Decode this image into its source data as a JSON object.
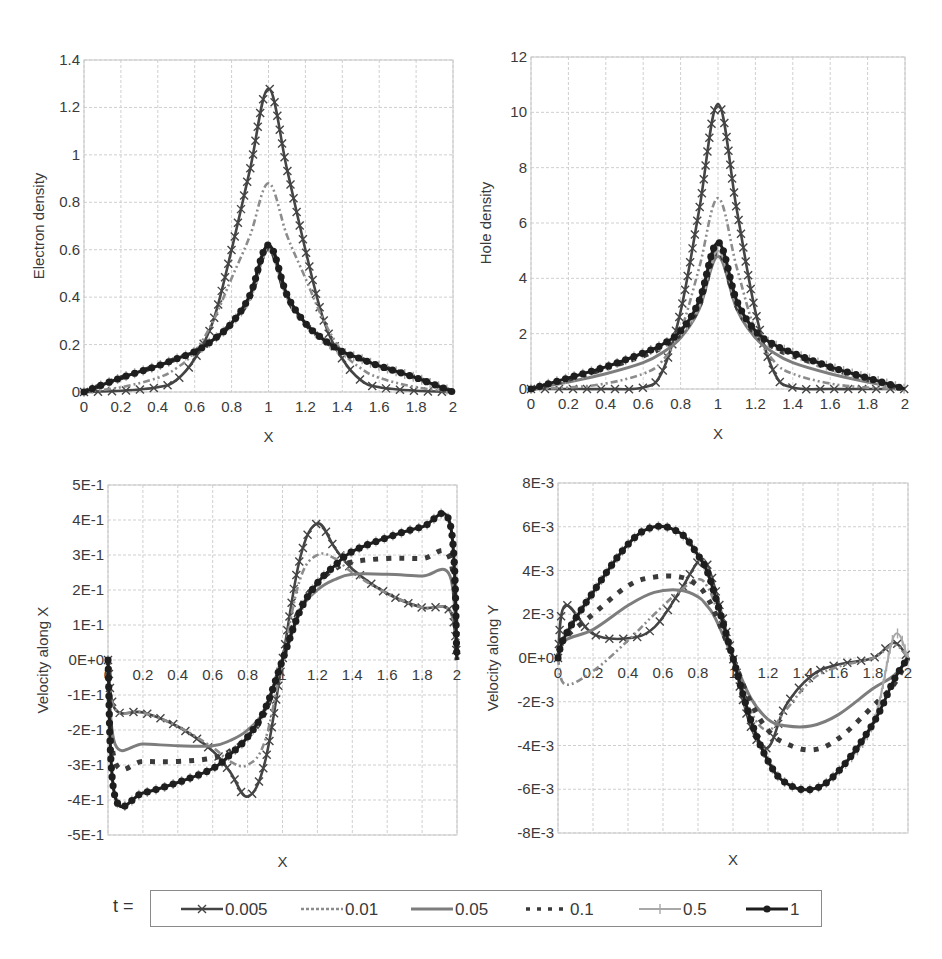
{
  "legend": {
    "title": "t =",
    "entries": [
      {
        "label": "0.005",
        "color": "#444444",
        "width": 2.6,
        "dash": "",
        "marker": "x"
      },
      {
        "label": "0.01",
        "color": "#8c8c8c",
        "width": 2.6,
        "dash": "7,3,2,3,2,3",
        "marker": ""
      },
      {
        "label": "0.05",
        "color": "#7d7d7d",
        "width": 3,
        "dash": "",
        "marker": ""
      },
      {
        "label": "0.1",
        "color": "#3a3a3a",
        "width": 5,
        "dash": "5,8",
        "marker": ""
      },
      {
        "label": "0.5",
        "color": "#a8a8a8",
        "width": 2,
        "dash": "",
        "marker": "plus"
      },
      {
        "label": "1",
        "color": "#1e1e1e",
        "width": 3,
        "dash": "",
        "marker": "dot"
      }
    ]
  },
  "chart_data": [
    {
      "id": "electron-density",
      "type": "line",
      "title": "",
      "xlabel": "X",
      "ylabel": "Electron density",
      "xlim": [
        0,
        2
      ],
      "ylim": [
        0,
        1.4
      ],
      "grid": true,
      "legend_position": "bottom (shared)",
      "frame": {
        "left": 84,
        "right": 453,
        "top": 60,
        "bottom": 392
      },
      "xticks": {
        "values": [
          0,
          0.2,
          0.4,
          0.6,
          0.8,
          1,
          1.2,
          1.4,
          1.6,
          1.8,
          2
        ],
        "labels": [
          "0",
          "0.2",
          "0.4",
          "0.6",
          "0.8",
          "1",
          "1.2",
          "1.4",
          "1.6",
          "1.8",
          "2"
        ],
        "label_zero": 0
      },
      "yticks": {
        "values": [
          0,
          0.2,
          0.4,
          0.6,
          0.8,
          1,
          1.2,
          1.4
        ],
        "labels": [
          "0",
          "0.2",
          "0.4",
          "0.6",
          "0.8",
          "1",
          "1.2",
          "1.4"
        ]
      },
      "x": [
        0,
        0.2,
        0.4,
        0.5,
        0.6,
        0.7,
        0.8,
        0.9,
        1.0,
        1.1,
        1.2,
        1.3,
        1.4,
        1.5,
        1.6,
        1.8,
        2.0
      ],
      "series": [
        {
          "name": "0.005",
          "values": [
            0.0,
            0.005,
            0.02,
            0.05,
            0.14,
            0.3,
            0.6,
            0.94,
            1.28,
            0.94,
            0.6,
            0.3,
            0.14,
            0.05,
            0.02,
            0.005,
            0.0
          ]
        },
        {
          "name": "0.01",
          "values": [
            0.0,
            0.02,
            0.06,
            0.1,
            0.17,
            0.3,
            0.48,
            0.66,
            0.88,
            0.66,
            0.48,
            0.3,
            0.17,
            0.1,
            0.06,
            0.02,
            0.0
          ]
        },
        {
          "name": "0.05",
          "values": [
            0.0,
            0.06,
            0.11,
            0.14,
            0.17,
            0.22,
            0.29,
            0.4,
            0.6,
            0.4,
            0.29,
            0.22,
            0.17,
            0.14,
            0.11,
            0.06,
            0.0
          ]
        },
        {
          "name": "0.1",
          "values": [
            0.0,
            0.06,
            0.11,
            0.14,
            0.17,
            0.22,
            0.29,
            0.4,
            0.61,
            0.4,
            0.29,
            0.22,
            0.17,
            0.14,
            0.11,
            0.06,
            0.0
          ]
        },
        {
          "name": "0.5",
          "values": [
            0.0,
            0.06,
            0.11,
            0.14,
            0.17,
            0.22,
            0.29,
            0.4,
            0.61,
            0.4,
            0.29,
            0.22,
            0.17,
            0.14,
            0.11,
            0.06,
            0.0
          ]
        },
        {
          "name": "1",
          "values": [
            0.0,
            0.06,
            0.11,
            0.14,
            0.17,
            0.22,
            0.29,
            0.41,
            0.62,
            0.41,
            0.29,
            0.22,
            0.17,
            0.14,
            0.11,
            0.06,
            0.0
          ]
        }
      ]
    },
    {
      "id": "hole-density",
      "type": "line",
      "title": "",
      "xlabel": "X",
      "ylabel": "Hole density",
      "xlim": [
        0,
        2
      ],
      "ylim": [
        0,
        12
      ],
      "grid": true,
      "legend_position": "bottom (shared)",
      "frame": {
        "left": 531,
        "right": 905,
        "top": 57,
        "bottom": 389
      },
      "xticks": {
        "values": [
          0,
          0.2,
          0.4,
          0.6,
          0.8,
          1,
          1.2,
          1.4,
          1.6,
          1.8,
          2
        ],
        "labels": [
          "0",
          "0.2",
          "0.4",
          "0.6",
          "0.8",
          "1",
          "1.2",
          "1.4",
          "1.6",
          "1.8",
          "2"
        ],
        "label_zero": 0
      },
      "yticks": {
        "values": [
          0,
          2,
          4,
          6,
          8,
          10,
          12
        ],
        "labels": [
          "0",
          "2",
          "4",
          "6",
          "8",
          "10",
          "12"
        ]
      },
      "x": [
        0,
        0.2,
        0.4,
        0.6,
        0.7,
        0.8,
        0.9,
        1.0,
        1.1,
        1.2,
        1.3,
        1.4,
        1.6,
        1.8,
        2.0
      ],
      "series": [
        {
          "name": "0.005",
          "values": [
            0.0,
            0.0,
            0.0,
            0.05,
            0.6,
            2.8,
            6.5,
            10.3,
            6.5,
            2.8,
            0.6,
            0.05,
            0.0,
            0.0,
            0.0
          ]
        },
        {
          "name": "0.01",
          "values": [
            0.0,
            0.05,
            0.2,
            0.55,
            1.0,
            2.1,
            4.4,
            6.9,
            4.4,
            2.1,
            1.0,
            0.55,
            0.2,
            0.05,
            0.0
          ]
        },
        {
          "name": "0.05",
          "values": [
            0.0,
            0.25,
            0.55,
            0.95,
            1.3,
            1.85,
            2.9,
            4.8,
            2.9,
            1.85,
            1.3,
            0.95,
            0.55,
            0.25,
            0.0
          ]
        },
        {
          "name": "0.1",
          "values": [
            0.0,
            0.35,
            0.75,
            1.2,
            1.5,
            2.0,
            3.0,
            5.0,
            3.0,
            2.0,
            1.5,
            1.2,
            0.75,
            0.35,
            0.0
          ]
        },
        {
          "name": "0.5",
          "values": [
            0.0,
            0.4,
            0.8,
            1.3,
            1.6,
            2.05,
            3.05,
            5.0,
            3.05,
            2.05,
            1.6,
            1.3,
            0.8,
            0.4,
            0.0
          ]
        },
        {
          "name": "1",
          "values": [
            0.0,
            0.4,
            0.8,
            1.3,
            1.6,
            2.1,
            3.2,
            5.3,
            3.2,
            2.1,
            1.6,
            1.3,
            0.8,
            0.4,
            0.0
          ]
        }
      ]
    },
    {
      "id": "velocity-x",
      "type": "line",
      "title": "",
      "xlabel": "X",
      "ylabel": "Velocity along X",
      "xlim": [
        0,
        2
      ],
      "ylim": [
        -0.5,
        0.5
      ],
      "grid": true,
      "legend_position": "bottom (shared)",
      "frame": {
        "left": 108,
        "right": 457,
        "top": 485,
        "bottom": 835
      },
      "xticks": {
        "values": [
          0,
          0.2,
          0.4,
          0.6,
          0.8,
          1,
          1.2,
          1.4,
          1.6,
          1.8,
          2
        ],
        "labels": [
          "0",
          "0.2",
          "0.4",
          "0.6",
          "0.8",
          "1",
          "1.2",
          "1.4",
          "1.6",
          "1.8",
          "2"
        ],
        "label_zero": 0
      },
      "yticks": {
        "values": [
          -0.5,
          -0.4,
          -0.3,
          -0.2,
          -0.1,
          0,
          0.1,
          0.2,
          0.3,
          0.4,
          0.5
        ],
        "labels": [
          "-5E-1",
          "-4E-1",
          "-3E-1",
          "-2E-1",
          "-1E-1",
          "0E+0",
          "1E-1",
          "2E-1",
          "3E-1",
          "4E-1",
          "5E-1"
        ]
      },
      "x": [
        0,
        0.04,
        0.2,
        0.4,
        0.6,
        0.7,
        0.8,
        0.9,
        1.0,
        1.1,
        1.2,
        1.3,
        1.4,
        1.6,
        1.8,
        1.96,
        2.0
      ],
      "series": [
        {
          "name": "0.005",
          "values": [
            0.0,
            -0.14,
            -0.15,
            -0.19,
            -0.26,
            -0.32,
            -0.39,
            -0.29,
            0.0,
            0.29,
            0.39,
            0.32,
            0.26,
            0.19,
            0.15,
            0.14,
            0.0
          ]
        },
        {
          "name": "0.01",
          "values": [
            0.0,
            -0.14,
            -0.15,
            -0.19,
            -0.25,
            -0.29,
            -0.3,
            -0.23,
            0.0,
            0.23,
            0.3,
            0.29,
            0.25,
            0.19,
            0.15,
            0.14,
            0.0
          ]
        },
        {
          "name": "0.05",
          "values": [
            0.0,
            -0.24,
            -0.24,
            -0.245,
            -0.245,
            -0.23,
            -0.2,
            -0.14,
            0.0,
            0.14,
            0.2,
            0.23,
            0.245,
            0.245,
            0.24,
            0.24,
            0.0
          ]
        },
        {
          "name": "0.1",
          "values": [
            0.0,
            -0.29,
            -0.29,
            -0.29,
            -0.28,
            -0.26,
            -0.22,
            -0.15,
            0.0,
            0.15,
            0.22,
            0.26,
            0.28,
            0.29,
            0.29,
            0.29,
            0.0
          ]
        },
        {
          "name": "0.5",
          "values": [
            0.0,
            -0.39,
            -0.38,
            -0.35,
            -0.31,
            -0.27,
            -0.22,
            -0.14,
            0.0,
            0.14,
            0.22,
            0.27,
            0.31,
            0.35,
            0.38,
            0.39,
            0.0
          ]
        },
        {
          "name": "1",
          "values": [
            0.0,
            -0.39,
            -0.38,
            -0.35,
            -0.31,
            -0.27,
            -0.22,
            -0.14,
            0.0,
            0.14,
            0.22,
            0.27,
            0.31,
            0.35,
            0.38,
            0.39,
            0.0
          ]
        }
      ]
    },
    {
      "id": "velocity-y",
      "type": "line",
      "title": "",
      "xlabel": "X",
      "ylabel": "Velocity along Y",
      "xlim": [
        0,
        2
      ],
      "ylim": [
        -0.008,
        0.008
      ],
      "grid": true,
      "legend_position": "bottom (shared)",
      "frame": {
        "left": 558,
        "right": 908,
        "top": 483,
        "bottom": 833
      },
      "xticks": {
        "values": [
          0,
          0.2,
          0.4,
          0.6,
          0.8,
          1,
          1.2,
          1.4,
          1.6,
          1.8,
          2
        ],
        "labels": [
          "0",
          "0.2",
          "0.4",
          "0.6",
          "0.8",
          "1",
          "1.2",
          "1.4",
          "1.6",
          "1.8",
          "2"
        ],
        "label_zero": 0
      },
      "yticks": {
        "values": [
          -0.008,
          -0.006,
          -0.004,
          -0.002,
          0,
          0.002,
          0.004,
          0.006,
          0.008
        ],
        "labels": [
          "-8E-3",
          "-6E-3",
          "-4E-3",
          "-2E-3",
          "0E+0",
          "2E-3",
          "4E-3",
          "6E-3",
          "8E-3"
        ]
      },
      "x": [
        0,
        0.04,
        0.2,
        0.4,
        0.55,
        0.7,
        0.8,
        0.85,
        0.9,
        1.0,
        1.1,
        1.2,
        1.3,
        1.45,
        1.6,
        1.8,
        1.92,
        2.0
      ],
      "series": [
        {
          "name": "0.005",
          "values": [
            0.0,
            0.0024,
            0.0011,
            0.0009,
            0.0014,
            0.0031,
            0.0044,
            0.0043,
            0.0031,
            0.0,
            -0.0031,
            -0.0041,
            -0.0022,
            -0.0008,
            -0.0003,
            0.0,
            0.0007,
            0.0
          ]
        },
        {
          "name": "0.01",
          "values": [
            0.0,
            -0.0012,
            -0.0006,
            0.0008,
            0.002,
            0.0031,
            0.0036,
            0.0033,
            0.0024,
            0.0,
            -0.0024,
            -0.0033,
            -0.0024,
            -0.001,
            -0.0004,
            0.0,
            0.0006,
            0.0
          ]
        },
        {
          "name": "0.05",
          "values": [
            0.0,
            0.0008,
            0.0013,
            0.0024,
            0.003,
            0.0031,
            0.0028,
            0.0024,
            0.0018,
            0.0,
            -0.0018,
            -0.0028,
            -0.0031,
            -0.0031,
            -0.0026,
            -0.0014,
            -0.0008,
            0.0
          ]
        },
        {
          "name": "0.1",
          "values": [
            0.0,
            0.0009,
            0.002,
            0.0033,
            0.0037,
            0.0037,
            0.0033,
            0.0028,
            0.002,
            0.0,
            -0.002,
            -0.0033,
            -0.0039,
            -0.0042,
            -0.0037,
            -0.0022,
            -0.0012,
            0.0
          ]
        },
        {
          "name": "0.5",
          "values": [
            0.0,
            0.001,
            0.003,
            0.0052,
            0.006,
            0.0057,
            0.0047,
            0.004,
            0.0028,
            0.0,
            -0.0028,
            -0.0047,
            -0.0057,
            -0.006,
            -0.0052,
            -0.003,
            0.001,
            0.0
          ]
        },
        {
          "name": "1",
          "values": [
            0.0,
            0.001,
            0.003,
            0.0052,
            0.006,
            0.0057,
            0.0047,
            0.004,
            0.0028,
            0.0,
            -0.0028,
            -0.0047,
            -0.0057,
            -0.006,
            -0.0052,
            -0.003,
            -0.001,
            0.0
          ]
        }
      ]
    }
  ]
}
